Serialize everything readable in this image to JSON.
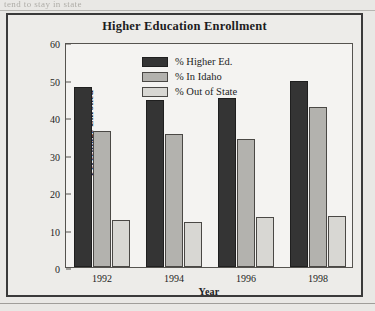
{
  "page": {
    "scan_fragment": "tend to stay in state"
  },
  "chart_data": {
    "type": "bar",
    "title": "Higher Education Enrollment",
    "xlabel": "Year",
    "ylabel": "Percentage Enrolled",
    "categories": [
      "1992",
      "1994",
      "1996",
      "1998"
    ],
    "ylim": [
      0,
      60
    ],
    "yticks": [
      0,
      10,
      20,
      30,
      40,
      50,
      60
    ],
    "ytick_labels": [
      "0",
      "10",
      "20",
      "30",
      "40",
      "50",
      "60"
    ],
    "grid": false,
    "legend_position": "upper center inside plot",
    "series": [
      {
        "name": "% Higher Ed.",
        "color": "#343434",
        "values": [
          48.1,
          44.5,
          45.0,
          49.5
        ]
      },
      {
        "name": "% In Idaho",
        "color": "#b3b2ae",
        "values": [
          36.3,
          35.4,
          34.1,
          42.7
        ]
      },
      {
        "name": "% Out of State",
        "color": "#d8d7d3",
        "values": [
          12.5,
          12.0,
          13.4,
          13.5
        ]
      }
    ]
  }
}
